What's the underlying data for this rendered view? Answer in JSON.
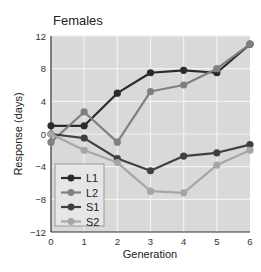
{
  "chart_data": {
    "type": "line",
    "title": "Females",
    "xlabel": "Generation",
    "ylabel": "Response (days)",
    "x": [
      0,
      1,
      2,
      3,
      4,
      5,
      6
    ],
    "xlim": [
      0,
      6
    ],
    "ylim": [
      -12,
      12
    ],
    "xticks": [
      "0",
      "1",
      "2",
      "3",
      "4",
      "5",
      "6"
    ],
    "yticks": [
      "12",
      "8",
      "4",
      "0",
      "−4",
      "−8",
      "−12"
    ],
    "grid": true,
    "legend_position": "lower left",
    "series": [
      {
        "name": "L1",
        "color": "#2b2b2b",
        "values": [
          1,
          1,
          5,
          7.5,
          7.8,
          7.5,
          11
        ]
      },
      {
        "name": "L2",
        "color": "#808080",
        "values": [
          -1,
          2.7,
          -1,
          5.2,
          6,
          8,
          11
        ]
      },
      {
        "name": "S1",
        "color": "#404040",
        "values": [
          0,
          -0.5,
          -3,
          -4.5,
          -2.7,
          -2.3,
          -1.3
        ]
      },
      {
        "name": "S2",
        "color": "#a6a6a6",
        "values": [
          0,
          -2,
          -3.5,
          -7,
          -7.2,
          -3.8,
          -2
        ]
      }
    ]
  },
  "colors": {
    "plot_background": "#d9d9d9",
    "grid": "#f2f2f2",
    "axis": "#333333"
  }
}
